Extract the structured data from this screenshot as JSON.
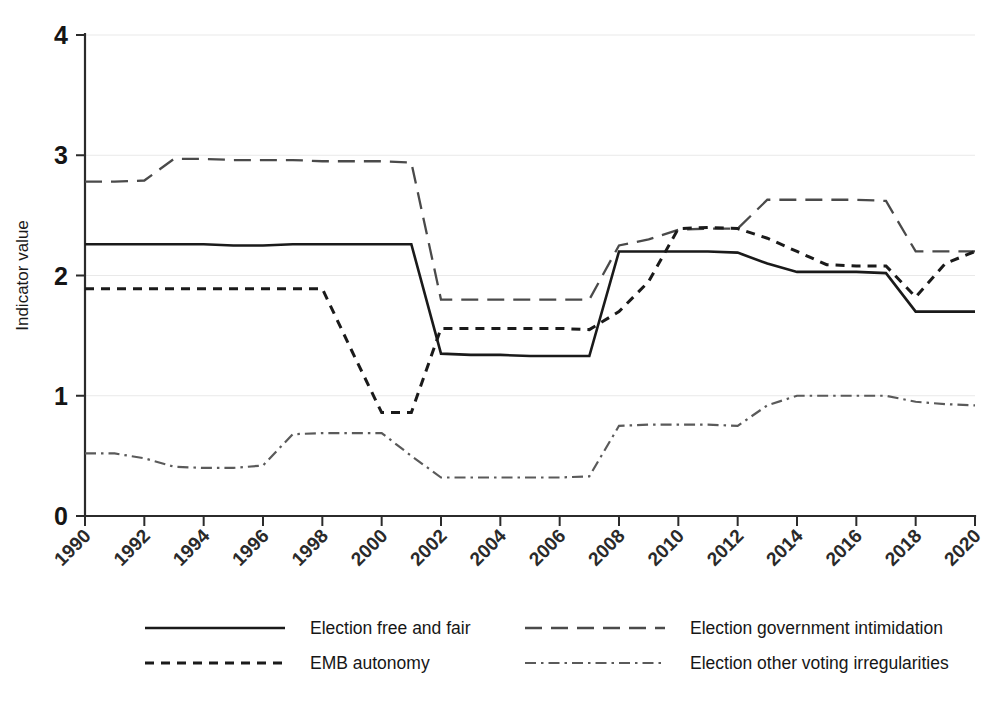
{
  "chart_data": {
    "type": "line",
    "title": "",
    "xlabel": "",
    "ylabel": "Indicator value",
    "xlim": [
      1990,
      2020
    ],
    "ylim": [
      0,
      4
    ],
    "grid": true,
    "legend_position": "bottom",
    "x": [
      1990,
      1991,
      1992,
      1993,
      1994,
      1995,
      1996,
      1997,
      1998,
      1999,
      2000,
      2001,
      2002,
      2003,
      2004,
      2005,
      2006,
      2007,
      2008,
      2009,
      2010,
      2011,
      2012,
      2013,
      2014,
      2015,
      2016,
      2017,
      2018,
      2019,
      2020
    ],
    "xticks": [
      "1990",
      "1992",
      "1994",
      "1996",
      "1998",
      "2000",
      "2002",
      "2004",
      "2006",
      "2008",
      "2010",
      "2012",
      "2014",
      "2016",
      "2018",
      "2020"
    ],
    "yticks": [
      "0",
      "1",
      "2",
      "3",
      "4"
    ],
    "series": [
      {
        "name": "Election free and fair",
        "style": "solid",
        "color": "#1a1a1a",
        "values": [
          2.26,
          2.26,
          2.26,
          2.26,
          2.26,
          2.25,
          2.25,
          2.26,
          2.26,
          2.26,
          2.26,
          2.26,
          1.35,
          1.34,
          1.34,
          1.33,
          1.33,
          1.33,
          2.2,
          2.2,
          2.2,
          2.2,
          2.19,
          2.1,
          2.03,
          2.03,
          2.03,
          2.02,
          1.7,
          1.7,
          1.7
        ]
      },
      {
        "name": "Election government intimidation",
        "style": "long-dash",
        "color": "#4a4a4a",
        "values": [
          2.78,
          2.78,
          2.79,
          2.97,
          2.97,
          2.96,
          2.96,
          2.96,
          2.95,
          2.95,
          2.95,
          2.94,
          1.8,
          1.8,
          1.8,
          1.8,
          1.8,
          1.8,
          2.25,
          2.3,
          2.38,
          2.39,
          2.39,
          2.63,
          2.63,
          2.63,
          2.63,
          2.62,
          2.2,
          2.2,
          2.2
        ]
      },
      {
        "name": "EMB autonomy",
        "style": "dash",
        "color": "#1a1a1a",
        "values": [
          1.89,
          1.89,
          1.89,
          1.89,
          1.89,
          1.89,
          1.89,
          1.89,
          1.89,
          1.37,
          0.86,
          0.86,
          1.56,
          1.56,
          1.56,
          1.56,
          1.56,
          1.55,
          1.7,
          1.95,
          2.39,
          2.4,
          2.39,
          2.31,
          2.2,
          2.09,
          2.08,
          2.08,
          1.82,
          2.1,
          2.2
        ]
      },
      {
        "name": "Election other voting irregularities",
        "style": "dash-dot",
        "color": "#5a5a5a",
        "values": [
          0.52,
          0.52,
          0.48,
          0.41,
          0.4,
          0.4,
          0.42,
          0.68,
          0.69,
          0.69,
          0.69,
          0.5,
          0.32,
          0.32,
          0.32,
          0.32,
          0.32,
          0.33,
          0.75,
          0.76,
          0.76,
          0.76,
          0.75,
          0.92,
          1.0,
          1.0,
          1.0,
          1.0,
          0.95,
          0.93,
          0.92
        ]
      }
    ]
  },
  "axes": {
    "y_title": "Indicator value"
  },
  "legend": {
    "items": [
      {
        "label": "Election free and fair",
        "style": "solid"
      },
      {
        "label": "Election government intimidation",
        "style": "long-dash"
      },
      {
        "label": "EMB autonomy",
        "style": "dash"
      },
      {
        "label": "Election other voting irregularities",
        "style": "dash-dot"
      }
    ]
  }
}
